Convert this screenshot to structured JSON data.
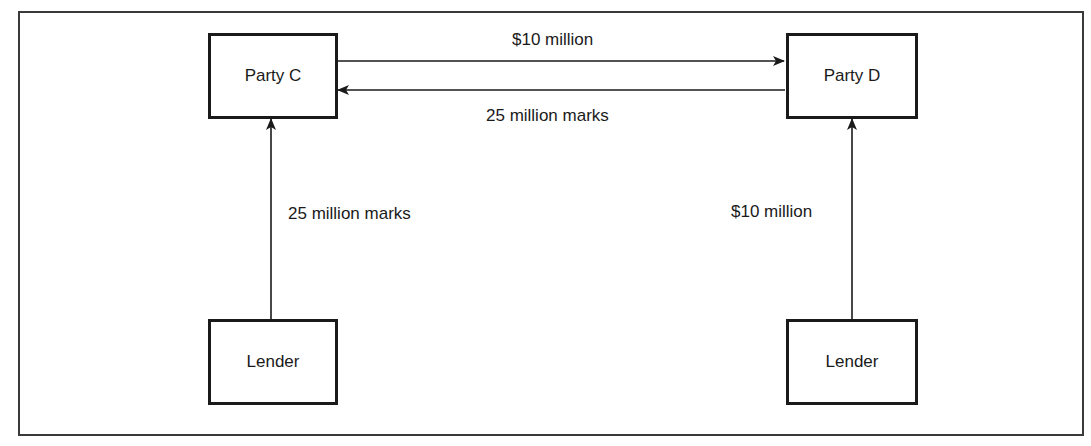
{
  "diagram": {
    "nodes": {
      "party_c": "Party C",
      "party_d": "Party D",
      "lender_left": "Lender",
      "lender_right": "Lender"
    },
    "edges": {
      "c_to_d": {
        "from": "Party C",
        "to": "Party D",
        "label": "$10 million"
      },
      "d_to_c": {
        "from": "Party D",
        "to": "Party C",
        "label": "25 million marks"
      },
      "lender_to_c": {
        "from": "Lender",
        "to": "Party C",
        "label": "25 million marks"
      },
      "lender_to_d": {
        "from": "Lender",
        "to": "Party D",
        "label": "$10 million"
      }
    }
  },
  "colors": {
    "stroke": "#1a1a1a",
    "frame": "#3a3a3a",
    "background": "#ffffff"
  }
}
